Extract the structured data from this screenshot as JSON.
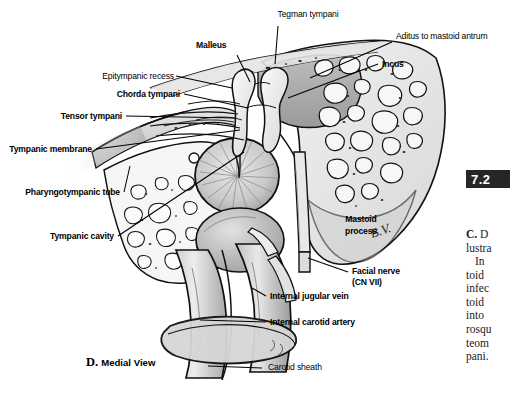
{
  "figure": {
    "caption": "D. Medial View",
    "caption_letter": "D.",
    "caption_text": "Medial View",
    "artist_signature": "B.V.",
    "background_color": "#ffffff",
    "ink_color": "#000000"
  },
  "badge": {
    "label": "7.2",
    "background": "#262626",
    "text_color": "#ffffff"
  },
  "labels": [
    {
      "id": "tegman-tympani",
      "text": "Tegman tympani",
      "weight": "regular"
    },
    {
      "id": "malleus",
      "text": "Malleus",
      "weight": "bold"
    },
    {
      "id": "aditus-to-mastoid-antrum",
      "text": "Aditus to mastoid antrum",
      "weight": "regular"
    },
    {
      "id": "incus",
      "text": "Incus",
      "weight": "bold"
    },
    {
      "id": "epitympanic-recess",
      "text": "Epitympanic recess",
      "weight": "regular"
    },
    {
      "id": "chorda-tympani",
      "text": "Chorda tympani",
      "weight": "bold"
    },
    {
      "id": "tensor-tympani",
      "text": "Tensor tympani",
      "weight": "bold"
    },
    {
      "id": "tympanic-membrane",
      "text": "Tympanic membrane",
      "weight": "bold"
    },
    {
      "id": "pharyngotympanic-tube",
      "text": "Pharyngotympanic tube",
      "weight": "bold"
    },
    {
      "id": "tympanic-cavity",
      "text": "Tympanic cavity",
      "weight": "bold"
    },
    {
      "id": "mastoid-process-line1",
      "text": "Mastoid",
      "weight": "bold"
    },
    {
      "id": "mastoid-process-line2",
      "text": "process",
      "weight": "bold"
    },
    {
      "id": "facial-nerve-line1",
      "text": "Facial nerve",
      "weight": "bold"
    },
    {
      "id": "facial-nerve-line2",
      "text": "(CN VII)",
      "weight": "bold"
    },
    {
      "id": "internal-jugular-vein",
      "text": "Internal jugular vein",
      "weight": "bold"
    },
    {
      "id": "internal-carotid-artery",
      "text": "Internal carotid artery",
      "weight": "bold"
    },
    {
      "id": "carotid-sheath",
      "text": "Carotid sheath",
      "weight": "regular"
    }
  ],
  "text_column": {
    "heading_bold": "C.",
    "heading_rest": " D",
    "lines": [
      "lustra",
      "In",
      "toid",
      "infec",
      "toid",
      "into",
      "rosqu",
      "teom",
      "pani."
    ]
  }
}
